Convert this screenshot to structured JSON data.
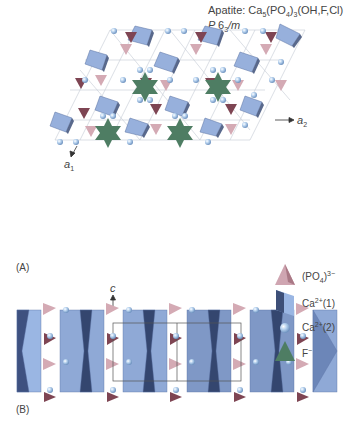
{
  "figure": {
    "title_prefix": "Apatite: Ca",
    "title_sub1": "5",
    "title_mid1": "(PO",
    "title_sub2": "4",
    "title_mid2": ")",
    "title_sub3": "3",
    "title_suffix": "(OH,F,Cl)",
    "space_group_p": "P ",
    "space_group_6": "6",
    "space_group_sub": "3",
    "space_group_m": "/m"
  },
  "panel_a": {
    "label": "(A)",
    "axis_a1": "a",
    "axis_a1_sub": "1",
    "axis_a2": "a",
    "axis_a2_sub": "2"
  },
  "panel_b": {
    "label": "(B)",
    "axis_c": "c"
  },
  "legend": {
    "items": [
      {
        "name": "(PO4)3-",
        "label_main": "(PO",
        "label_sub": "4",
        "label_close": ")",
        "label_sup": "3−",
        "color": "#c9a0ac"
      },
      {
        "name": "Ca2+(1)",
        "label_main": "Ca",
        "label_sup": "2+",
        "label_tail": "(1)",
        "color": "#7f9bcc"
      },
      {
        "name": "Ca2+(2)",
        "label_main": "Ca",
        "label_sup": "2+",
        "label_tail": "(2)",
        "color": "#a9c6e6"
      },
      {
        "name": "F-",
        "label_main": "F",
        "label_sup": "−",
        "color": "#4f7f67"
      }
    ]
  },
  "colors": {
    "po4_light": "#d2aab4",
    "po4_dark": "#7f4552",
    "ca1_light": "#9fb8e0",
    "ca1_dark": "#3d4f78",
    "ca2_sphere": "#a8c8ea",
    "fluorine": "#4e7d63",
    "lattice_line": "#b9bfc9"
  }
}
